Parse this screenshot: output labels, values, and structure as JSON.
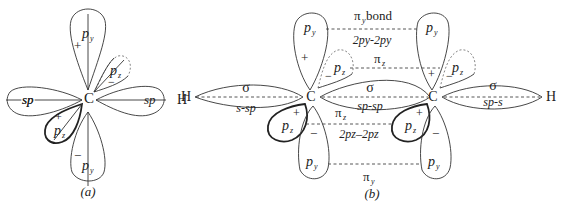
{
  "figure_a": {
    "caption": "(a)",
    "atom": "C",
    "hydrogen": "H",
    "labels": {
      "py_top": "p",
      "py_top_sub": "y",
      "py_bottom": "p",
      "py_bottom_sub": "y",
      "pz_back": "p",
      "pz_back_sub": "z",
      "pz_front": "p",
      "pz_front_sub": "z",
      "sp_left": "sp",
      "sp_right": "sp"
    },
    "signs": {
      "py_top": "+",
      "py_bottom": "−",
      "pz_back": "−",
      "pz_front": "+"
    }
  },
  "figure_b": {
    "caption": "(b)",
    "atom_left": "C",
    "atom_right": "C",
    "hydrogen_left": "H",
    "hydrogen_right": "H",
    "bonds": {
      "pi_y_top_label": "π",
      "pi_y_top_sub": "y",
      "pi_y_top_suffix": " bond",
      "pi_y_top_overlap": "2p",
      "pi_y_top_overlap_text": "2py-2py",
      "pi_z_top_label": "π",
      "pi_z_top_sub": "z",
      "sigma_left": "σ",
      "sigma_left_type": "s-sp",
      "sigma_center": "σ",
      "sigma_center_type": "sp-sp",
      "sigma_right": "σ",
      "sigma_right_type": "sp-s",
      "pi_z_bottom_label": "π",
      "pi_z_bottom_sub": "z",
      "pi_z_bottom_overlap_text": "2pz–2pz",
      "pi_y_bottom_label": "π",
      "pi_y_bottom_sub": "y"
    },
    "orbital_labels": {
      "p": "p",
      "y": "y",
      "z": "z"
    },
    "signs": {
      "plus": "+",
      "minus": "−"
    }
  }
}
